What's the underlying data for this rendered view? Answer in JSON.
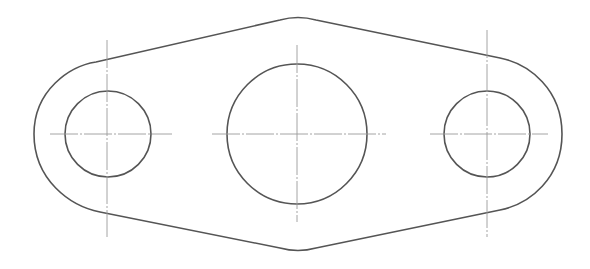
{
  "drawing": {
    "title": "",
    "colors": {
      "outline": "#555555",
      "centerline": "#9a9a9a",
      "background": "#ffffff"
    },
    "outline": {
      "left_lobe": {
        "cx": 107,
        "cy": 134,
        "r": 74
      },
      "right_lobe": {
        "cx": 487,
        "cy": 134,
        "r": 75
      },
      "top_peak": {
        "x": 298,
        "y": 18
      },
      "bottom_peak": {
        "x": 298,
        "y": 251
      }
    },
    "holes": [
      {
        "name": "left-hole",
        "cx": 108,
        "cy": 134,
        "r": 43
      },
      {
        "name": "center-hole",
        "cx": 297,
        "cy": 134,
        "r": 70
      },
      {
        "name": "right-hole",
        "cx": 487,
        "cy": 134,
        "r": 43
      }
    ],
    "centerlines": [
      {
        "name": "left-vertical",
        "x1": 107,
        "y1": 40,
        "x2": 107,
        "y2": 237
      },
      {
        "name": "left-horizontal",
        "x1": 50,
        "y1": 134,
        "x2": 172,
        "y2": 134
      },
      {
        "name": "center-vertical",
        "x1": 297,
        "y1": 45,
        "x2": 297,
        "y2": 222
      },
      {
        "name": "center-horizontal",
        "x1": 212,
        "y1": 134,
        "x2": 386,
        "y2": 134
      },
      {
        "name": "right-vertical",
        "x1": 487,
        "y1": 30,
        "x2": 487,
        "y2": 237
      },
      {
        "name": "right-horizontal",
        "x1": 430,
        "y1": 134,
        "x2": 548,
        "y2": 134
      }
    ]
  }
}
